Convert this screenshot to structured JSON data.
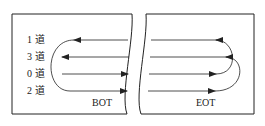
{
  "tracks": [
    {
      "label": "1 道",
      "y": 40,
      "direction": "left"
    },
    {
      "label": "3 道",
      "y": 57,
      "direction": "left"
    },
    {
      "label": "0 道",
      "y": 74,
      "direction": "right"
    },
    {
      "label": "2 道",
      "y": 91,
      "direction": "right"
    }
  ],
  "markers": {
    "bot": "BOT",
    "eot": "EOT"
  },
  "colors": {
    "line": "#222222",
    "background": "#ffffff"
  }
}
